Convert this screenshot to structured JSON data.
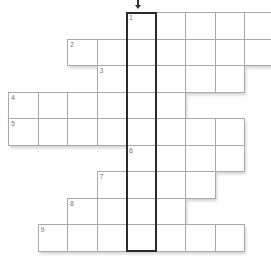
{
  "puzzle": {
    "type": "crossword",
    "grid": {
      "origin_x": 8,
      "origin_y": 12,
      "cell_w": 29.5,
      "cell_h": 26.5,
      "rows": [
        {
          "row": 0,
          "start_col": 4,
          "end_col": 8,
          "number": "1"
        },
        {
          "row": 1,
          "start_col": 2,
          "end_col": 8,
          "number": "2"
        },
        {
          "row": 2,
          "start_col": 3,
          "end_col": 7,
          "number": "3"
        },
        {
          "row": 3,
          "start_col": 0,
          "end_col": 5,
          "number": "4"
        },
        {
          "row": 4,
          "start_col": 0,
          "end_col": 7,
          "number": "5"
        },
        {
          "row": 5,
          "start_col": 4,
          "end_col": 7,
          "number": "6"
        },
        {
          "row": 6,
          "start_col": 3,
          "end_col": 6,
          "number": "7"
        },
        {
          "row": 7,
          "start_col": 2,
          "end_col": 5,
          "number": "8"
        },
        {
          "row": 8,
          "start_col": 1,
          "end_col": 7,
          "number": "9"
        }
      ]
    },
    "highlight": {
      "description": "vertical solution column",
      "col": 4,
      "from_row": 0,
      "to_row": 8,
      "border_color": "#2a2a2a"
    },
    "arrow": {
      "direction": "down",
      "col": 4,
      "icon": "arrow-down-icon"
    },
    "colors": {
      "cell_border": "#a9a9a9",
      "cell_bg": "#ffffff",
      "number_text": "#777777"
    }
  }
}
